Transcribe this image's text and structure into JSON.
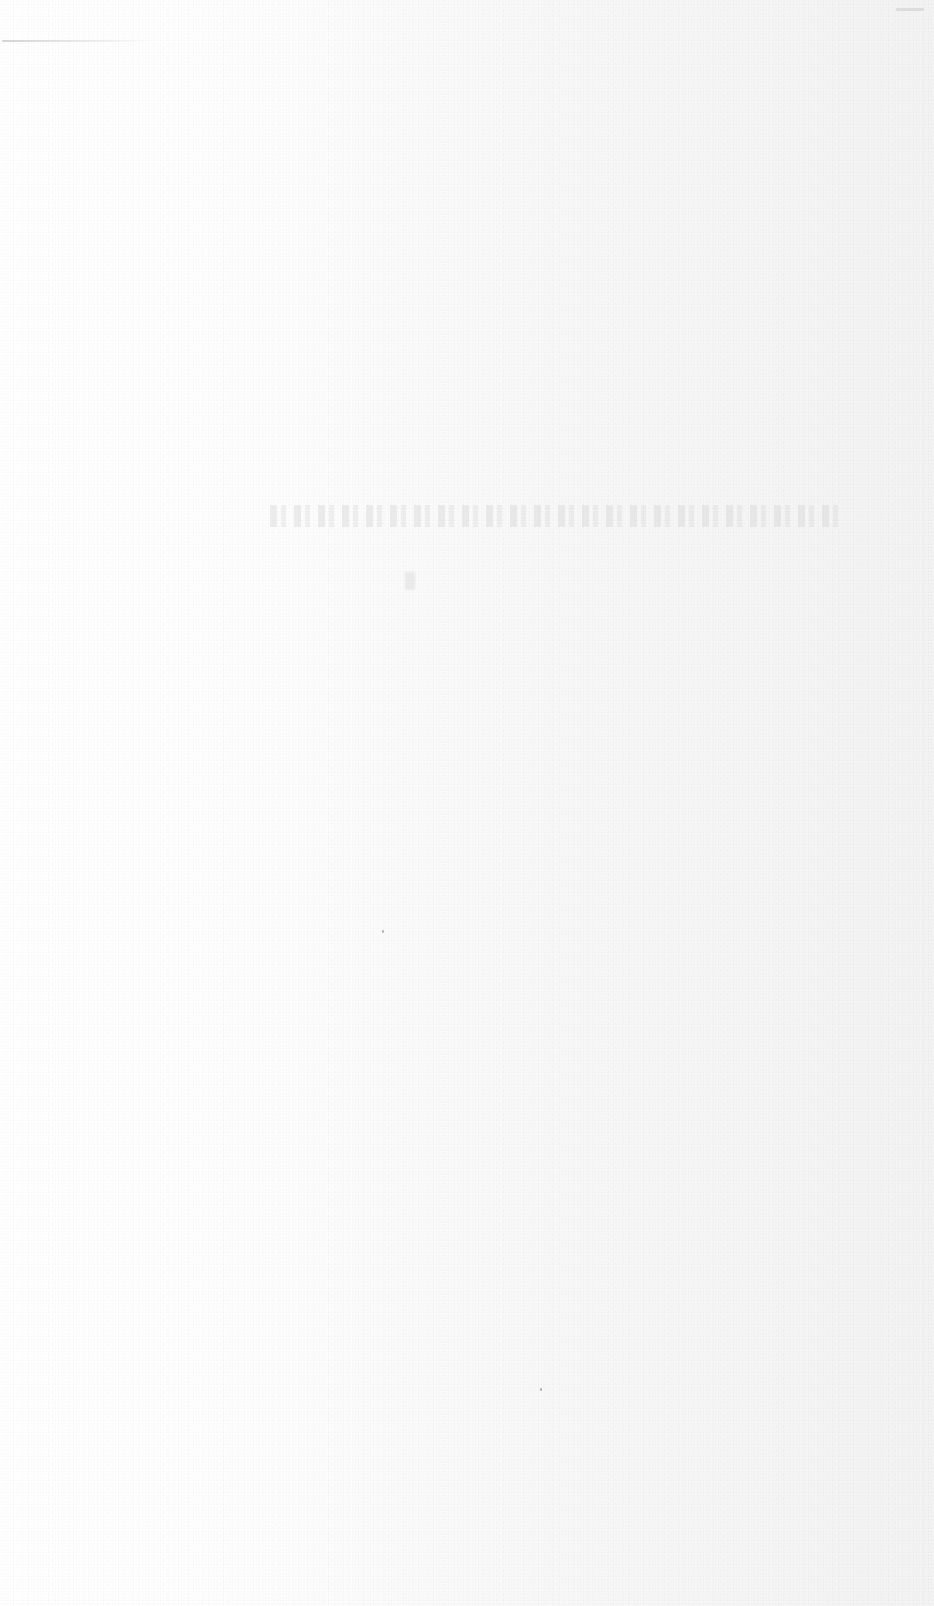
{
  "document": {
    "type": "scanned-page",
    "legible_text": [],
    "background_color": "#fbfbfb"
  }
}
